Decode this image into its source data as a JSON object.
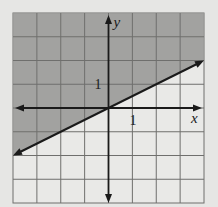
{
  "chart_data": {
    "type": "line",
    "title": "",
    "xlabel": "x",
    "ylabel": "y",
    "xlim": [
      -4,
      4
    ],
    "ylim": [
      -4,
      4
    ],
    "grid": true,
    "tick_labels": {
      "x_unit": "1",
      "y_unit": "1"
    },
    "boundary_line": {
      "equation": "y = x/2",
      "slope": 0.5,
      "intercept": 0,
      "style": "solid",
      "arrows": "both",
      "points": [
        [
          -4,
          -2
        ],
        [
          4,
          2
        ]
      ]
    },
    "shaded_region": "above line (y >= x/2)",
    "x": [
      -4,
      4
    ],
    "series": [
      {
        "name": "boundary",
        "values": [
          -2,
          2
        ]
      }
    ]
  },
  "colors": {
    "background": "#e6e6e4",
    "plot_bg": "#e9e9e7",
    "shade": "#9a9a98",
    "grid": "#6f6f6d",
    "axis": "#1a1a1a",
    "line": "#1a1a1a"
  }
}
